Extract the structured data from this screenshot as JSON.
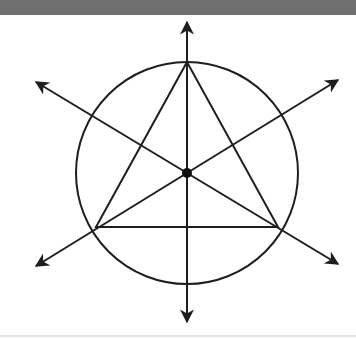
{
  "figure": {
    "colors": {
      "top_bar": "#6f6f6f",
      "stroke": "#1e1e1e",
      "background": "#ffffff",
      "bottom_rule": "#e4e4e4"
    },
    "center": {
      "x": 187,
      "y": 158
    },
    "circle": {
      "cx": 187,
      "cy": 158,
      "r": 111
    },
    "triangle": {
      "points": [
        [
          187,
          47
        ],
        [
          96,
          212
        ],
        [
          278,
          212
        ]
      ]
    },
    "lines": [
      {
        "name": "vertical-axis",
        "x1": 187,
        "y1": 7,
        "x2": 187,
        "y2": 307
      },
      {
        "name": "diagonal-down-right",
        "x1": 36,
        "y1": 67,
        "x2": 338,
        "y2": 249
      },
      {
        "name": "diagonal-up-right",
        "x1": 338,
        "y1": 65,
        "x2": 36,
        "y2": 251
      }
    ],
    "center_dot_radius": 5
  }
}
